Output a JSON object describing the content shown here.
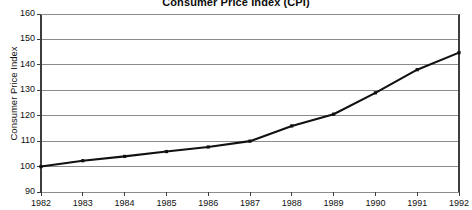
{
  "chart_data": {
    "type": "line",
    "title": "Consumer Price Index (CPI)",
    "xlabel": "",
    "ylabel": "Consumer Price Index",
    "categories": [
      "1982",
      "1983",
      "1984",
      "1985",
      "1986",
      "1987",
      "1988",
      "1989",
      "1990",
      "1991",
      "1992"
    ],
    "x": [
      1982,
      1983,
      1984,
      1985,
      1986,
      1987,
      1988,
      1989,
      1990,
      1991,
      1992
    ],
    "values": [
      100.0,
      102.3,
      104.0,
      105.9,
      107.7,
      110.0,
      116.0,
      120.6,
      129.0,
      138.1,
      144.8
    ],
    "series": [
      {
        "name": "Consumer Price Index",
        "values": [
          100.0,
          102.3,
          104.0,
          105.9,
          107.7,
          110.0,
          116.0,
          120.6,
          129.0,
          138.1,
          144.8
        ]
      }
    ],
    "ylim": [
      90,
      160
    ],
    "ytick_step": 10,
    "yticks": [
      90,
      100,
      110,
      120,
      130,
      140,
      150,
      160
    ],
    "ytick_labels": [
      "90",
      "100",
      "110",
      "120",
      "130",
      "140",
      "150",
      "160"
    ],
    "xlim": [
      1982,
      1992
    ],
    "grid": "horizontal",
    "legend": "none",
    "marker": "square",
    "colors": {
      "line": "#111111",
      "marker": "#111111",
      "grid": "#8c8c8c",
      "axis": "#3d3d3d",
      "text": "#111111",
      "background": "#ffffff"
    }
  }
}
